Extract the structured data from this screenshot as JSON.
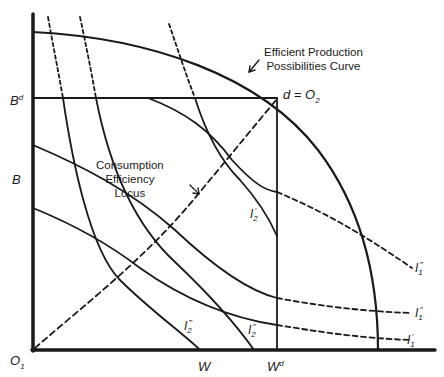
{
  "diagram": {
    "type": "edgeworth-box-production-possibilities",
    "colors": {
      "ink": "#1a1a1a",
      "background": "#ffffff"
    },
    "axes": {
      "origin_label": "O",
      "origin_sub": "1",
      "y_labels": [
        {
          "id": "Bd",
          "text": "B",
          "sup": "d"
        },
        {
          "id": "B",
          "text": "B"
        }
      ],
      "x_labels": [
        {
          "id": "W",
          "text": "W"
        },
        {
          "id": "Wd",
          "text": "W",
          "sup": "d"
        }
      ]
    },
    "point_d": {
      "text": "d = O",
      "sub": "2"
    },
    "annotations": {
      "ppc": {
        "line1": "Efficient Production",
        "line2": "Possibilities Curve"
      },
      "locus": {
        "line1": "Consumption",
        "line2": "Efficiency",
        "line3": "Locus"
      }
    },
    "indifference_curves": {
      "person1": [
        {
          "id": "I1-prime",
          "base": "I",
          "sub": "1",
          "prime": "′"
        },
        {
          "id": "I1-double-prime",
          "base": "I",
          "sub": "1",
          "prime": "″"
        },
        {
          "id": "I1-triple-prime",
          "base": "I",
          "sub": "1",
          "prime": "‴"
        }
      ],
      "person2": [
        {
          "id": "I2-prime",
          "base": "I",
          "sub": "2",
          "prime": "′"
        },
        {
          "id": "I2-double-prime",
          "base": "I",
          "sub": "2",
          "prime": "″"
        },
        {
          "id": "I2-triple-prime",
          "base": "I",
          "sub": "2",
          "prime": "‴"
        }
      ]
    }
  }
}
